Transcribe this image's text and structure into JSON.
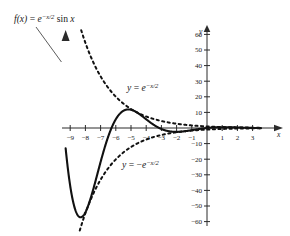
{
  "figure": {
    "title_label": "f(x) = e^{-x/2} sin x",
    "background_color": "#ffffff",
    "curve_color": "#111111"
  },
  "labels": {
    "function_label": {
      "f": "f",
      "paren_x": "(x)",
      "equals": " = ",
      "e": "e",
      "exponent": "−x/2",
      "sin": " sin ",
      "x": "x"
    },
    "upper_envelope": {
      "y": "y",
      "equals": " = ",
      "e": "e",
      "exponent": "−x/2"
    },
    "lower_envelope": {
      "y": "y",
      "equals": " = ",
      "minus": "−",
      "e": "e",
      "exponent": "−x/2"
    },
    "x_axis_name": "x",
    "y_axis_name": "y"
  },
  "chart_data": {
    "type": "line",
    "xlabel": "x",
    "ylabel": "y",
    "xlim": [
      -9.35,
      3.6
    ],
    "ylim": [
      -62,
      66
    ],
    "grid": false,
    "legend": "inline-annotations",
    "x_ticks": [
      -9,
      -8,
      -7,
      -6,
      -5,
      -4,
      -3,
      -2,
      -1,
      1,
      2,
      3
    ],
    "x_tick_labels": [
      "-9",
      "-8",
      "-7",
      "-6",
      "-5",
      "-4",
      "-3",
      "-2",
      "-1",
      "1",
      "2",
      "3"
    ],
    "y_ticks": [
      -60,
      -50,
      -40,
      -30,
      -20,
      -10,
      10,
      20,
      30,
      40,
      50,
      60
    ],
    "y_tick_labels": [
      "-60",
      "-50",
      "-40",
      "-30",
      "-20",
      "-10",
      "10",
      "20",
      "30",
      "40",
      "50",
      "60"
    ],
    "series": [
      {
        "name": "f(x) = e^{-x/2} sin x",
        "style": "solid",
        "formula": "exp(-x/2)*sin(x)",
        "domain": [
          -9.3,
          3.55
        ],
        "key_points": [
          {
            "x": -9.3,
            "y": 6.6,
            "note": "left end, rising off top"
          },
          {
            "x": -9.0,
            "y": 37.1,
            "note": "near top of frame"
          },
          {
            "x": -8.85,
            "y": 31.2,
            "note": "arrow tip region"
          },
          {
            "x": -9.425,
            "y": 0,
            "note": "zero crossing (-3pi)"
          },
          {
            "x": -7.854,
            "y": -51.0,
            "note": "near local minimum"
          },
          {
            "x": -7.6,
            "y": -55.2,
            "note": "local minimum ~ -55"
          },
          {
            "x": -6.283,
            "y": 0,
            "note": "zero crossing (-2pi)"
          },
          {
            "x": -4.9,
            "y": 16.0,
            "note": "local maximum ~16"
          },
          {
            "x": -3.142,
            "y": 0,
            "note": "zero crossing (-pi)"
          },
          {
            "x": -2.0,
            "y": -2.47,
            "note": "shallow minimum"
          },
          {
            "x": 0,
            "y": 0,
            "note": "origin"
          },
          {
            "x": 1.57,
            "y": 0.46,
            "note": "small local maximum"
          },
          {
            "x": 3.142,
            "y": 0,
            "note": "zero crossing (pi)"
          },
          {
            "x": 3.55,
            "y": -0.07,
            "note": "right end, decaying"
          }
        ]
      },
      {
        "name": "y = e^{-x/2}",
        "style": "dashed",
        "formula": "exp(-x/2)",
        "domain": [
          -8.6,
          3.55
        ],
        "key_points": [
          {
            "x": -8.6,
            "y": 73.7,
            "note": "off top of frame"
          },
          {
            "x": -8.2,
            "y": 60.3
          },
          {
            "x": -6.0,
            "y": 20.1
          },
          {
            "x": -4.9,
            "y": 11.6
          },
          {
            "x": -3.0,
            "y": 4.5
          },
          {
            "x": 0,
            "y": 1.0
          },
          {
            "x": 3.55,
            "y": 0.17
          }
        ]
      },
      {
        "name": "y = -e^{-x/2}",
        "style": "dashed",
        "formula": "-exp(-x/2)",
        "domain": [
          -8.6,
          3.55
        ],
        "key_points": [
          {
            "x": -8.6,
            "y": -73.7,
            "note": "off bottom of frame"
          },
          {
            "x": -8.0,
            "y": -54.6
          },
          {
            "x": -7.6,
            "y": -44.7
          },
          {
            "x": -6.0,
            "y": -20.1
          },
          {
            "x": -3.0,
            "y": -4.5
          },
          {
            "x": 0,
            "y": -1.0
          },
          {
            "x": 3.55,
            "y": -0.17
          }
        ]
      }
    ],
    "annotations": [
      {
        "text": "f(x) = e^{-x/2} sin x",
        "x": -9.0,
        "y": 60,
        "has_leader_line": true,
        "leader_to": {
          "x": -9.05,
          "y": 30
        }
      },
      {
        "text": "y = e^{-x/2}",
        "x": -5.4,
        "y": 31
      },
      {
        "text": "y = -e^{-x/2}",
        "x": -5.0,
        "y": -31
      }
    ]
  }
}
